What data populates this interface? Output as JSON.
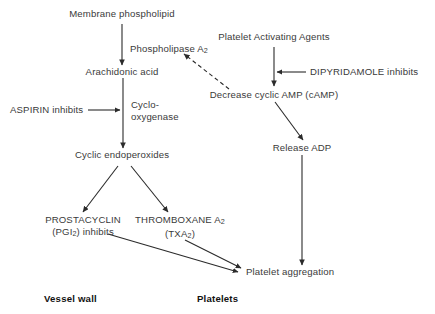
{
  "diagram": {
    "background_color": "#ffffff",
    "text_color": "#3a3a3a",
    "label_color": "#111111",
    "stroke_color": "#2b2b2b",
    "nodes": {
      "membrane_phospholipid": "Membrane phospholipid",
      "phospholipase": "Phospholipase A",
      "phospholipase_sub": "2",
      "arachidonic_acid": "Arachidonic acid",
      "aspirin": "ASPIRIN inhibits",
      "cyclo": "Cyclo-",
      "oxygenase": "oxygenase",
      "cyclic_endoperoxides": "Cyclic endoperoxides",
      "prostacyclin": "PROSTACYCLIN",
      "pgi2_pre": "(PGI",
      "pgi2_sub": "2",
      "pgi2_post": ") inhibits",
      "thromboxane": "THROMBOXANE A",
      "thromboxane_sub": "2",
      "txa2_pre": "(TXA",
      "txa2_sub": "2",
      "txa2_post": ")",
      "platelet_activating_agents": "Platelet Activating Agents",
      "dipyridamole": "DIPYRIDAMOLE inhibits",
      "decrease_camp": "Decrease cyclic AMP (cAMP)",
      "release_adp": "Release ADP",
      "platelet_aggregation": "Platelet aggregation"
    },
    "region_labels": {
      "vessel_wall": "Vessel wall",
      "platelets": "Platelets"
    }
  }
}
